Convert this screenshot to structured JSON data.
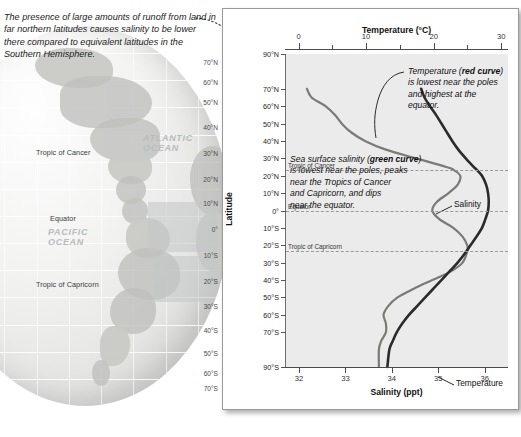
{
  "caption": {
    "text": "The presence of large amounts of runoff from land in far northern latitudes causes salinity to be lower there compared to equivalent latitudes in the Southern Hemisphere."
  },
  "globe": {
    "labels": [
      {
        "name": "tropic-of-cancer",
        "text": "Tropic of Cancer",
        "x": 36,
        "y": 148
      },
      {
        "name": "equator",
        "text": "Equator",
        "x": 50,
        "y": 214
      },
      {
        "name": "tropic-of-capricorn",
        "text": "Tropic of Capricorn",
        "x": 36,
        "y": 280
      }
    ],
    "ocean_labels": [
      {
        "name": "atlantic-ocean-label",
        "line1": "ATLANTIC",
        "line2": "OCEAN",
        "x": 143,
        "y": 133
      },
      {
        "name": "pacific-ocean-label",
        "line1": "PACIFIC",
        "line2": "OCEAN",
        "x": 48,
        "y": 227
      }
    ],
    "latitudes": [
      {
        "text": "70°N",
        "y": 59
      },
      {
        "text": "60°N",
        "y": 79
      },
      {
        "text": "50°N",
        "y": 99
      },
      {
        "text": "40°N",
        "y": 124
      },
      {
        "text": "30°N",
        "y": 150
      },
      {
        "text": "20°N",
        "y": 176
      },
      {
        "text": "10°N",
        "y": 200
      },
      {
        "text": "0°",
        "y": 226
      },
      {
        "text": "10°S",
        "y": 252
      },
      {
        "text": "20°S",
        "y": 278
      },
      {
        "text": "30°S",
        "y": 303
      },
      {
        "text": "40°S",
        "y": 327
      },
      {
        "text": "50°S",
        "y": 350
      },
      {
        "text": "60°S",
        "y": 370
      },
      {
        "text": "70°S",
        "y": 385
      }
    ]
  },
  "chart_data": {
    "type": "line",
    "title": "",
    "orientation": "vertical",
    "ylabel": "Latitude",
    "ylim": [
      -90,
      90
    ],
    "ytick_labels": [
      "90°N",
      "70°N",
      "60°N",
      "50°N",
      "40°N",
      "30°N",
      "20°N",
      "10°N",
      "0°",
      "10°S",
      "20°S",
      "30°S",
      "40°S",
      "50°S",
      "60°S",
      "70°S",
      "90°S"
    ],
    "ytick_values": [
      90,
      70,
      60,
      50,
      40,
      30,
      20,
      10,
      0,
      -10,
      -20,
      -30,
      -40,
      -50,
      -60,
      -70,
      -90
    ],
    "top_axis": {
      "label": "Temperature (°C)",
      "ticks": [
        0,
        5,
        10,
        15,
        20,
        25,
        30
      ],
      "tick_labels": [
        "0",
        "",
        "10",
        "",
        "20",
        "",
        "30"
      ],
      "range": [
        -2,
        31
      ]
    },
    "bottom_axis": {
      "label": "Salinity (ppt)",
      "ticks": [
        32,
        33,
        34,
        35,
        36
      ],
      "tick_labels": [
        "32",
        "33",
        "34",
        "35",
        "36"
      ],
      "range": [
        31.7,
        36.5
      ]
    },
    "reference_lines": [
      {
        "name": "tropic-of-cancer-line",
        "label": "Tropic of Cancer",
        "latitude": 23.5
      },
      {
        "name": "equator-line",
        "label": "Equator",
        "latitude": 0
      },
      {
        "name": "tropic-of-capricorn-line",
        "label": "Tropic of Capricorn",
        "latitude": -23.5
      }
    ],
    "series": [
      {
        "name": "Salinity",
        "color": "#7a7a78",
        "unit": "ppt",
        "axis": "bottom",
        "label_text": "Salinity",
        "points": [
          {
            "lat": 70,
            "value": 32.15
          },
          {
            "lat": 65,
            "value": 32.25
          },
          {
            "lat": 60,
            "value": 32.55
          },
          {
            "lat": 55,
            "value": 32.75
          },
          {
            "lat": 50,
            "value": 32.9
          },
          {
            "lat": 45,
            "value": 33.1
          },
          {
            "lat": 40,
            "value": 33.4
          },
          {
            "lat": 35,
            "value": 33.85
          },
          {
            "lat": 30,
            "value": 34.5
          },
          {
            "lat": 25,
            "value": 35.15
          },
          {
            "lat": 23.5,
            "value": 35.3
          },
          {
            "lat": 20,
            "value": 35.45
          },
          {
            "lat": 15,
            "value": 35.4
          },
          {
            "lat": 10,
            "value": 35.2
          },
          {
            "lat": 5,
            "value": 34.95
          },
          {
            "lat": 0,
            "value": 34.85
          },
          {
            "lat": -5,
            "value": 35.0
          },
          {
            "lat": -10,
            "value": 35.3
          },
          {
            "lat": -15,
            "value": 35.5
          },
          {
            "lat": -20,
            "value": 35.6
          },
          {
            "lat": -23.5,
            "value": 35.6
          },
          {
            "lat": -30,
            "value": 35.5
          },
          {
            "lat": -35,
            "value": 35.25
          },
          {
            "lat": -40,
            "value": 34.85
          },
          {
            "lat": -45,
            "value": 34.45
          },
          {
            "lat": -50,
            "value": 34.1
          },
          {
            "lat": -55,
            "value": 33.9
          },
          {
            "lat": -60,
            "value": 33.8
          },
          {
            "lat": -65,
            "value": 33.85
          },
          {
            "lat": -70,
            "value": 33.85
          },
          {
            "lat": -75,
            "value": 33.75
          },
          {
            "lat": -80,
            "value": 33.7
          },
          {
            "lat": -90,
            "value": 33.7
          }
        ]
      },
      {
        "name": "Temperature",
        "color": "#2b2b2b",
        "unit": "°C",
        "axis": "top",
        "label_text": "Temperature",
        "points": [
          {
            "lat": 70,
            "value": 18.0
          },
          {
            "lat": 65,
            "value": 18.5
          },
          {
            "lat": 60,
            "value": 19.3
          },
          {
            "lat": 55,
            "value": 20.2
          },
          {
            "lat": 50,
            "value": 21.0
          },
          {
            "lat": 45,
            "value": 21.8
          },
          {
            "lat": 40,
            "value": 22.6
          },
          {
            "lat": 35,
            "value": 23.5
          },
          {
            "lat": 30,
            "value": 24.6
          },
          {
            "lat": 25,
            "value": 25.8
          },
          {
            "lat": 23.5,
            "value": 26.2
          },
          {
            "lat": 20,
            "value": 27.0
          },
          {
            "lat": 15,
            "value": 27.6
          },
          {
            "lat": 10,
            "value": 27.9
          },
          {
            "lat": 5,
            "value": 28.0
          },
          {
            "lat": 0,
            "value": 27.9
          },
          {
            "lat": -5,
            "value": 27.5
          },
          {
            "lat": -10,
            "value": 27.0
          },
          {
            "lat": -15,
            "value": 26.2
          },
          {
            "lat": -20,
            "value": 25.3
          },
          {
            "lat": -23.5,
            "value": 24.7
          },
          {
            "lat": -30,
            "value": 23.4
          },
          {
            "lat": -35,
            "value": 22.2
          },
          {
            "lat": -40,
            "value": 21.0
          },
          {
            "lat": -45,
            "value": 19.8
          },
          {
            "lat": -50,
            "value": 18.6
          },
          {
            "lat": -55,
            "value": 17.4
          },
          {
            "lat": -60,
            "value": 16.2
          },
          {
            "lat": -65,
            "value": 15.2
          },
          {
            "lat": -70,
            "value": 14.4
          },
          {
            "lat": -75,
            "value": 13.8
          },
          {
            "lat": -80,
            "value": 13.3
          },
          {
            "lat": -90,
            "value": 13.0
          }
        ]
      }
    ],
    "annotations": [
      {
        "name": "temperature-annotation",
        "lines": [
          [
            {
              "t": "Temperature ("
            },
            {
              "t": "red curve",
              "bold": true
            },
            {
              "t": ")"
            }
          ],
          [
            {
              "t": "is lowest near the poles"
            }
          ],
          [
            {
              "t": "and highest at the"
            }
          ],
          [
            {
              "t": "equator."
            }
          ]
        ]
      },
      {
        "name": "salinity-annotation",
        "lines": [
          [
            {
              "t": "Sea surface salinity ("
            },
            {
              "t": "green curve",
              "bold": true
            },
            {
              "t": ")"
            }
          ],
          [
            {
              "t": "is lowest near the poles, peaks"
            }
          ],
          [
            {
              "t": "near the Tropics of Cancer"
            }
          ],
          [
            {
              "t": "and Capricorn, and dips"
            }
          ],
          [
            {
              "t": "near the equator."
            }
          ]
        ]
      }
    ]
  }
}
